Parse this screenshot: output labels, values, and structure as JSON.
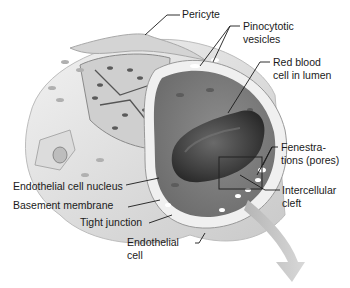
{
  "figure": {
    "labels": {
      "pericyte": "Pericyte",
      "pinocytotic_1": "Pinocytotic",
      "pinocytotic_2": "vesicles",
      "rbc_1": "Red blood",
      "rbc_2": "cell in lumen",
      "fenestrations_1": "Fenestra-",
      "fenestrations_2": "tions (pores)",
      "intercellular_1": "Intercellular",
      "intercellular_2": "cleft",
      "nucleus": "Endothelial cell nucleus",
      "basement": "Basement membrane",
      "tight_junction": "Tight junction",
      "endothelial_1": "Endothelial",
      "endothelial_2": "cell"
    }
  }
}
